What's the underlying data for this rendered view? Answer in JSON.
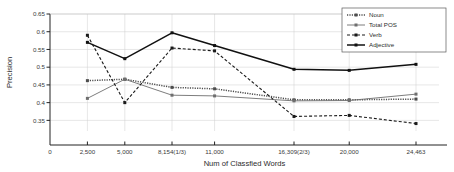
{
  "chart_data": {
    "type": "line",
    "title": "",
    "xlabel": "Num of Classfied Words",
    "ylabel": "Precision",
    "grid": true,
    "legend_position": "top-right",
    "x": [
      2500,
      5000,
      8154,
      11000,
      16309,
      20000,
      24463
    ],
    "categories": [
      "2,500",
      "5,000",
      "8,154(1/3)",
      "11,000",
      "16,309(2/3)",
      "20,000",
      "24,463"
    ],
    "xtick_labels": [
      "0",
      "2,500",
      "5,000",
      "8,154(1/3)",
      "11,000",
      "16,309(2/3)",
      "20,000",
      "24,463"
    ],
    "xtick_values": [
      0,
      2500,
      5000,
      8154,
      11000,
      16309,
      20000,
      24463
    ],
    "xlim": [
      0,
      26000
    ],
    "ytick_labels": [
      "0.35",
      "0.4",
      "0.45",
      "0.5",
      "0.55",
      "0.6",
      "0.65"
    ],
    "ytick_values": [
      0.35,
      0.4,
      0.45,
      0.5,
      0.55,
      0.6,
      0.65
    ],
    "ylim": [
      0.32,
      0.65
    ],
    "series": [
      {
        "name": "Noun",
        "style": "dotted-thick",
        "color": "#4d4d4d",
        "marker": "square",
        "values": [
          0.462,
          0.466,
          0.443,
          0.439,
          0.408,
          0.408,
          0.41
        ]
      },
      {
        "name": "Total POS",
        "style": "solid-thin",
        "color": "#6e6e6e",
        "marker": "square",
        "values": [
          0.412,
          0.466,
          0.421,
          0.419,
          0.405,
          0.406,
          0.424
        ]
      },
      {
        "name": "Verb",
        "style": "dashed",
        "color": "#1a1a1a",
        "marker": "square",
        "values": [
          0.59,
          0.4,
          0.554,
          0.546,
          0.361,
          0.364,
          0.341
        ]
      },
      {
        "name": "Adjective",
        "style": "solid-thick",
        "color": "#111111",
        "marker": "square",
        "values": [
          0.57,
          0.524,
          0.597,
          0.561,
          0.494,
          0.491,
          0.508
        ]
      }
    ]
  },
  "legend": {
    "items": [
      {
        "label": "Noun"
      },
      {
        "label": "Total POS"
      },
      {
        "label": "Verb"
      },
      {
        "label": "Adjective"
      }
    ]
  }
}
